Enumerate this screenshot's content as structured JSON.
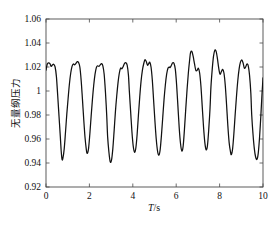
{
  "chart_data": {
    "type": "line",
    "title": "",
    "subtitle": "",
    "xlabel": "T/s",
    "xlabel_parts": {
      "symbol": "T",
      "unit": "/s"
    },
    "ylabel": "无量纲压力",
    "xlim": [
      0,
      10
    ],
    "ylim": [
      0.92,
      1.06
    ],
    "xticks": [
      0,
      2,
      4,
      6,
      8,
      10
    ],
    "xtick_labels": [
      "0",
      "2",
      "4",
      "6",
      "8",
      "10"
    ],
    "yticks": [
      0.92,
      0.94,
      0.96,
      0.98,
      1.0,
      1.02,
      1.04,
      1.06
    ],
    "ytick_labels": [
      "0.92",
      "0.94",
      "0.96",
      "0.98",
      "1",
      "1.02",
      "1.04",
      "1.06"
    ],
    "grid": false,
    "legend": null,
    "legend_position": "none",
    "line_color": "#111111",
    "axis_color": "#4a4a4a",
    "background_color": "#ffffff",
    "series": [
      {
        "name": "无量纲压力",
        "x": [
          0.0,
          0.06,
          0.12,
          0.18,
          0.24,
          0.3,
          0.36,
          0.42,
          0.48,
          0.54,
          0.6,
          0.66,
          0.7,
          0.74,
          0.78,
          0.84,
          0.9,
          0.96,
          1.02,
          1.08,
          1.14,
          1.2,
          1.26,
          1.32,
          1.38,
          1.44,
          1.5,
          1.56,
          1.62,
          1.68,
          1.74,
          1.8,
          1.86,
          1.9,
          1.96,
          2.02,
          2.08,
          2.14,
          2.2,
          2.26,
          2.32,
          2.38,
          2.44,
          2.5,
          2.56,
          2.62,
          2.68,
          2.74,
          2.8,
          2.84,
          2.9,
          2.96,
          3.02,
          3.08,
          3.14,
          3.2,
          3.26,
          3.32,
          3.38,
          3.44,
          3.5,
          3.56,
          3.62,
          3.68,
          3.74,
          3.8,
          3.84,
          3.9,
          3.96,
          4.02,
          4.08,
          4.14,
          4.2,
          4.26,
          4.32,
          4.38,
          4.44,
          4.5,
          4.56,
          4.62,
          4.68,
          4.74,
          4.78,
          4.84,
          4.9,
          4.96,
          5.02,
          5.08,
          5.14,
          5.2,
          5.26,
          5.32,
          5.38,
          5.44,
          5.5,
          5.56,
          5.62,
          5.68,
          5.72,
          5.78,
          5.84,
          5.9,
          5.96,
          6.02,
          6.08,
          6.14,
          6.2,
          6.26,
          6.32,
          6.38,
          6.44,
          6.5,
          6.56,
          6.62,
          6.66,
          6.72,
          6.78,
          6.84,
          6.9,
          6.96,
          7.02,
          7.08,
          7.14,
          7.2,
          7.26,
          7.32,
          7.38,
          7.44,
          7.5,
          7.56,
          7.6,
          7.66,
          7.72,
          7.78,
          7.84,
          7.9,
          7.96,
          8.02,
          8.08,
          8.14,
          8.2,
          8.26,
          8.32,
          8.38,
          8.44,
          8.5,
          8.54,
          8.6,
          8.66,
          8.72,
          8.78,
          8.84,
          8.9,
          8.96,
          9.02,
          9.08,
          9.14,
          9.2,
          9.26,
          9.32,
          9.38,
          9.44,
          9.48,
          9.54,
          9.6,
          9.66,
          9.72,
          9.78,
          9.84,
          9.9,
          9.95,
          10.0
        ],
        "y": [
          1.0175,
          1.0225,
          1.0235,
          1.0228,
          1.0205,
          1.0218,
          1.0222,
          1.02,
          1.012,
          0.996,
          0.979,
          0.962,
          0.95,
          0.943,
          0.944,
          0.952,
          0.966,
          0.981,
          0.994,
          1.006,
          1.015,
          1.0205,
          1.0225,
          1.0218,
          1.023,
          1.0245,
          1.0238,
          1.02,
          1.009,
          0.993,
          0.976,
          0.961,
          0.951,
          0.948,
          0.952,
          0.964,
          0.979,
          0.993,
          1.005,
          1.014,
          1.0195,
          1.021,
          1.0205,
          1.0218,
          1.0228,
          1.021,
          1.014,
          0.999,
          0.979,
          0.962,
          0.949,
          0.941,
          0.9425,
          0.952,
          0.967,
          0.983,
          0.996,
          1.007,
          1.015,
          1.019,
          1.0185,
          1.0205,
          1.023,
          1.0235,
          1.0215,
          1.013,
          1.0,
          0.983,
          0.966,
          0.954,
          0.949,
          0.9525,
          0.964,
          0.98,
          0.995,
          1.008,
          1.017,
          1.0225,
          1.026,
          1.0245,
          1.0215,
          1.023,
          1.024,
          1.02,
          1.009,
          0.992,
          0.975,
          0.96,
          0.95,
          0.9465,
          0.951,
          0.963,
          0.978,
          0.993,
          1.005,
          1.014,
          1.019,
          1.02,
          1.0195,
          1.0215,
          1.0235,
          1.023,
          1.018,
          1.005,
          0.987,
          0.969,
          0.956,
          0.95,
          0.954,
          0.968,
          0.985,
          1.001,
          1.015,
          1.026,
          1.032,
          1.033,
          1.029,
          1.023,
          1.0175,
          1.017,
          1.019,
          1.015,
          1.004,
          0.987,
          0.97,
          0.957,
          0.951,
          0.9545,
          0.968,
          0.986,
          1.003,
          1.018,
          1.029,
          1.034,
          1.033,
          1.027,
          1.019,
          1.014,
          1.016,
          1.018,
          1.015,
          1.005,
          0.989,
          0.971,
          0.957,
          0.9495,
          0.947,
          0.952,
          0.965,
          0.981,
          0.996,
          1.009,
          1.0185,
          1.024,
          1.026,
          1.0235,
          1.019,
          1.02,
          1.0225,
          1.021,
          1.013,
          0.998,
          0.98,
          0.964,
          0.952,
          0.945,
          0.943,
          0.948,
          0.961,
          0.979,
          0.996,
          1.011
        ]
      }
    ]
  },
  "figure": {
    "plot_area": {
      "left": 46,
      "top": 19,
      "right": 263,
      "bottom": 187
    }
  }
}
